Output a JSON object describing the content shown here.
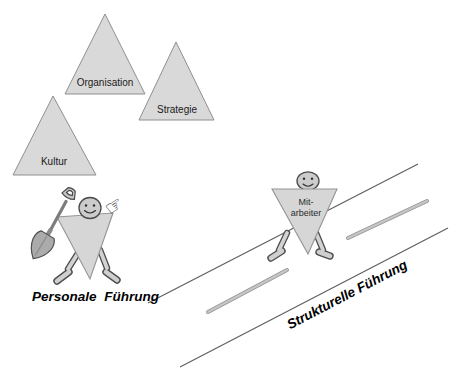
{
  "diagram": {
    "triangles": [
      {
        "label": "Organisation"
      },
      {
        "label": "Strategie"
      },
      {
        "label": "Kultur"
      }
    ],
    "personale": {
      "caption": "Personale Führung",
      "hand_glyph": "☞"
    },
    "mitarbeiter": {
      "label_line1": "Mit-",
      "label_line2": "arbeiter"
    },
    "strukturelle": {
      "caption": "Strukturelle Führung"
    },
    "colors": {
      "triangle_fill": "#d9d9d9",
      "triangle_stroke": "#8f8f8f",
      "figure_fill": "#d6d6d6",
      "head_fill": "#cccccc",
      "thin_line": "#5f5f5f",
      "thick_bar": "#b3b3b3",
      "text": "#000000"
    }
  }
}
